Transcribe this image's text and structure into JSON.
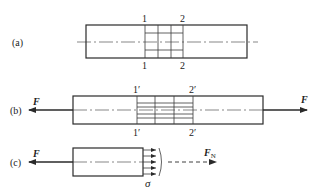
{
  "figure": {
    "panels": [
      {
        "id": "a",
        "label": "(a)",
        "section_labels_top": [
          "1",
          "2"
        ],
        "section_labels_bottom": [
          "1",
          "2"
        ]
      },
      {
        "id": "b",
        "label": "(b)",
        "section_labels_top": [
          "1′",
          "2′"
        ],
        "section_labels_bottom": [
          "1′",
          "2′"
        ],
        "force_left": "F",
        "force_right": "F"
      },
      {
        "id": "c",
        "label": "(c)",
        "force_left": "F",
        "stress_symbol": "σ",
        "resultant_force": "F",
        "resultant_subscript": "N"
      }
    ],
    "colors": {
      "line": "#2a2a2a",
      "background": "#ffffff"
    }
  }
}
